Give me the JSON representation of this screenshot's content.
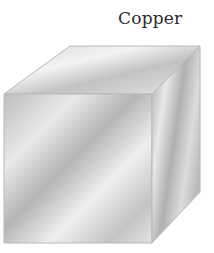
{
  "figure": {
    "label": "Copper",
    "object": "cube",
    "colors": {
      "edge": "#b8b8b8",
      "face_light": "#f2f2f2",
      "face_mid": "#cfcfcf",
      "face_dark": "#a9a9a9"
    }
  }
}
